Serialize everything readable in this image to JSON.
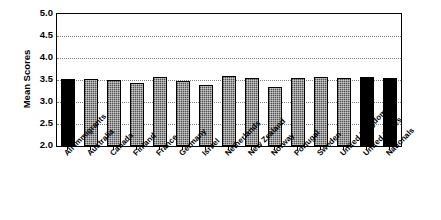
{
  "chart_data": {
    "type": "bar",
    "title": "",
    "xlabel": "",
    "ylabel": "Mean Scores",
    "ylim": [
      2.0,
      5.0
    ],
    "ytick_labels": [
      "5.0",
      "4.5",
      "4.0",
      "3.5",
      "3.0",
      "2.5",
      "2.0"
    ],
    "ytick_values": [
      5.0,
      4.5,
      4.0,
      3.5,
      3.0,
      2.5,
      2.0
    ],
    "grid": true,
    "legend": "none",
    "categories": [
      "All Immigrants",
      "Australia",
      "Canada",
      "Finland",
      "France",
      "Germany",
      "Israel",
      "Netherlands",
      "New Zealand",
      "Norway",
      "Portugal",
      "Sweden",
      "United Kingdom",
      "United States",
      "Nationals"
    ],
    "values": [
      3.53,
      3.53,
      3.49,
      3.43,
      3.57,
      3.48,
      3.38,
      3.58,
      3.55,
      3.34,
      3.54,
      3.56,
      3.55,
      3.57,
      3.55
    ],
    "bar_colors": [
      "#000000",
      "#7a7a7a",
      "#7a7a7a",
      "#7a7a7a",
      "#7a7a7a",
      "#7a7a7a",
      "#7a7a7a",
      "#7a7a7a",
      "#7a7a7a",
      "#7a7a7a",
      "#7a7a7a",
      "#7a7a7a",
      "#7a7a7a",
      "#000000",
      "#000000"
    ],
    "colors": {
      "highlight": "#000000",
      "standard": "#7a7a7a",
      "axis": "#000000",
      "gridline": "#808080",
      "background": "#ffffff"
    }
  }
}
